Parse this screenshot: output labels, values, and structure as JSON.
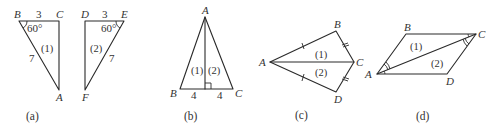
{
  "figures": {
    "a": {
      "caption": "(a)",
      "triangle1": {
        "vertices": {
          "B": "B",
          "C": "C",
          "A": "A"
        },
        "side_top": "3",
        "side_hyp": "7",
        "angle": "60°",
        "region": "(1)"
      },
      "triangle2": {
        "vertices": {
          "D": "D",
          "E": "E",
          "F": "F"
        },
        "side_top": "3",
        "side_hyp": "7",
        "angle": "60°",
        "region": "(2)"
      }
    },
    "b": {
      "caption": "(b)",
      "vertices": {
        "A": "A",
        "B": "B",
        "C": "C"
      },
      "left_base": "4",
      "right_base": "4",
      "region1": "(1)",
      "region2": "(2)"
    },
    "c": {
      "caption": "(c)",
      "vertices": {
        "A": "A",
        "B": "B",
        "C": "C",
        "D": "D"
      },
      "region1": "(1)",
      "region2": "(2)"
    },
    "d": {
      "caption": "(d)",
      "vertices": {
        "A": "A",
        "B": "B",
        "C": "C",
        "D": "D"
      },
      "region1": "(1)",
      "region2": "(2)"
    }
  }
}
